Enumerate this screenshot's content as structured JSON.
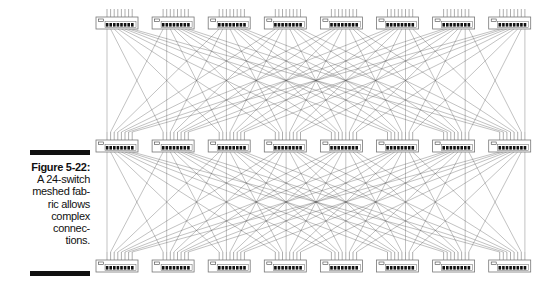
{
  "caption": {
    "figure_label": "Figure 5-22:",
    "lines": [
      "A 24-switch",
      "meshed fab-",
      "ric allows",
      "complex",
      "connec-",
      "tions."
    ]
  },
  "diagram": {
    "type": "meshed-switch-fabric",
    "total_switches": 24,
    "rows": 3,
    "switches_per_row": 8,
    "ports_per_switch": 8,
    "row_labels": [
      "tier-1",
      "tier-2",
      "tier-3"
    ],
    "switch_icon": "network-switch-icon",
    "line_color": "#555555",
    "switch_outline_color": "#777777",
    "port_color": "#111111"
  }
}
